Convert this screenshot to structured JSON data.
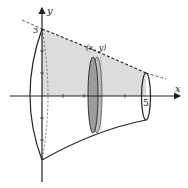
{
  "figure": {
    "type": "solid-of-revolution-disk-method",
    "axis_labels": {
      "x": "x",
      "y": "y"
    },
    "point_label": "(x, y)",
    "tick_labels": {
      "y_top": "3",
      "x_end": "5"
    },
    "colors": {
      "stroke": "#222222",
      "region_fill": "#d9d9d9",
      "disk_fill": "#a8a8a8",
      "disk_edge": "#7a7a7a",
      "background": "#ffffff"
    }
  }
}
